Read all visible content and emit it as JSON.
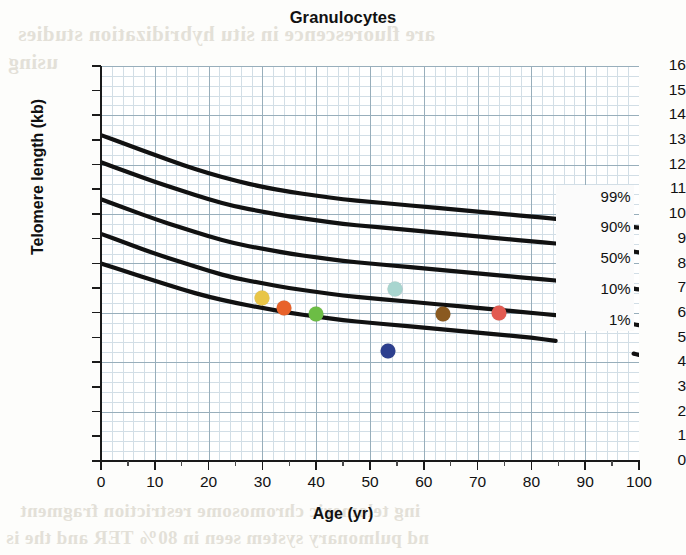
{
  "chart_data": {
    "type": "line",
    "title": "Granulocytes",
    "xlabel": "Age (yr)",
    "ylabel": "Telomere length (kb)",
    "xlim": [
      0,
      100
    ],
    "ylim": [
      0,
      16
    ],
    "xticks": [
      0,
      10,
      20,
      30,
      40,
      50,
      60,
      70,
      80,
      90,
      100
    ],
    "yticks": [
      0,
      1,
      2,
      3,
      4,
      5,
      6,
      7,
      8,
      9,
      10,
      11,
      12,
      13,
      14,
      15,
      16
    ],
    "grid": true,
    "grid_color": "#c3d4de",
    "legend_position": "inline-right",
    "series": [
      {
        "name": "99%",
        "label": "99%",
        "color": "#111111",
        "x": [
          0,
          5,
          10,
          15,
          20,
          25,
          30,
          35,
          40,
          45,
          50,
          55,
          60,
          65,
          70,
          75,
          80,
          85,
          90,
          95,
          100
        ],
        "values": [
          13.2,
          12.8,
          12.4,
          12.0,
          11.65,
          11.35,
          11.1,
          10.9,
          10.75,
          10.6,
          10.5,
          10.4,
          10.3,
          10.2,
          10.1,
          10.0,
          9.9,
          9.8,
          9.7,
          9.6,
          9.45
        ]
      },
      {
        "name": "90%",
        "label": "90%",
        "color": "#111111",
        "x": [
          0,
          5,
          10,
          15,
          20,
          25,
          30,
          35,
          40,
          45,
          50,
          55,
          60,
          65,
          70,
          75,
          80,
          85,
          90,
          95,
          100
        ],
        "values": [
          12.1,
          11.7,
          11.3,
          10.95,
          10.6,
          10.3,
          10.1,
          9.9,
          9.75,
          9.6,
          9.5,
          9.4,
          9.3,
          9.2,
          9.1,
          9.0,
          8.9,
          8.8,
          8.7,
          8.6,
          8.45
        ]
      },
      {
        "name": "50%",
        "label": "50%",
        "color": "#111111",
        "x": [
          0,
          5,
          10,
          15,
          20,
          25,
          30,
          35,
          40,
          45,
          50,
          55,
          60,
          65,
          70,
          75,
          80,
          85,
          90,
          95,
          100
        ],
        "values": [
          10.6,
          10.2,
          9.8,
          9.45,
          9.1,
          8.8,
          8.6,
          8.4,
          8.25,
          8.1,
          8.0,
          7.9,
          7.8,
          7.7,
          7.6,
          7.5,
          7.4,
          7.3,
          7.2,
          7.1,
          6.95
        ]
      },
      {
        "name": "10%",
        "label": "10%",
        "color": "#111111",
        "x": [
          0,
          5,
          10,
          15,
          20,
          25,
          30,
          35,
          40,
          45,
          50,
          55,
          60,
          65,
          70,
          75,
          80,
          85,
          90,
          95,
          100
        ],
        "values": [
          9.2,
          8.8,
          8.4,
          8.05,
          7.7,
          7.4,
          7.2,
          7.0,
          6.85,
          6.7,
          6.6,
          6.5,
          6.4,
          6.3,
          6.2,
          6.1,
          6.0,
          5.9,
          5.8,
          5.7,
          5.5
        ]
      },
      {
        "name": "1%",
        "label": "1%",
        "color": "#111111",
        "x": [
          0,
          5,
          10,
          15,
          20,
          25,
          30,
          35,
          40,
          45,
          50,
          55,
          60,
          65,
          70,
          75,
          80,
          85,
          90,
          95,
          100
        ],
        "values": [
          8.0,
          7.65,
          7.3,
          6.95,
          6.65,
          6.4,
          6.2,
          6.0,
          5.85,
          5.7,
          5.6,
          5.5,
          5.4,
          5.3,
          5.2,
          5.1,
          5.0,
          4.85,
          4.7,
          4.55,
          4.3
        ]
      }
    ],
    "points": [
      {
        "name": "point-yellow",
        "age": 30.0,
        "telomere_kb": 6.6,
        "color": "#e8c547"
      },
      {
        "name": "point-orange",
        "age": 34.0,
        "telomere_kb": 6.2,
        "color": "#e8622a"
      },
      {
        "name": "point-green",
        "age": 40.0,
        "telomere_kb": 5.95,
        "color": "#6cbd45"
      },
      {
        "name": "point-navy",
        "age": 53.3,
        "telomere_kb": 4.45,
        "color": "#2d3f8e"
      },
      {
        "name": "point-teal",
        "age": 54.6,
        "telomere_kb": 6.95,
        "color": "#a8d5cf"
      },
      {
        "name": "point-brown",
        "age": 63.6,
        "telomere_kb": 5.95,
        "color": "#8a5a20"
      },
      {
        "name": "point-red",
        "age": 74.0,
        "telomere_kb": 6.0,
        "color": "#e25b52"
      }
    ]
  },
  "page_bleed": {
    "line1": "are fluorescence in situ hybridization studies",
    "line2": "using",
    "line3": "ing telomeric chromosome restriction fragment",
    "line4": "nd pulmonary system seen in 80% TER and the is"
  }
}
